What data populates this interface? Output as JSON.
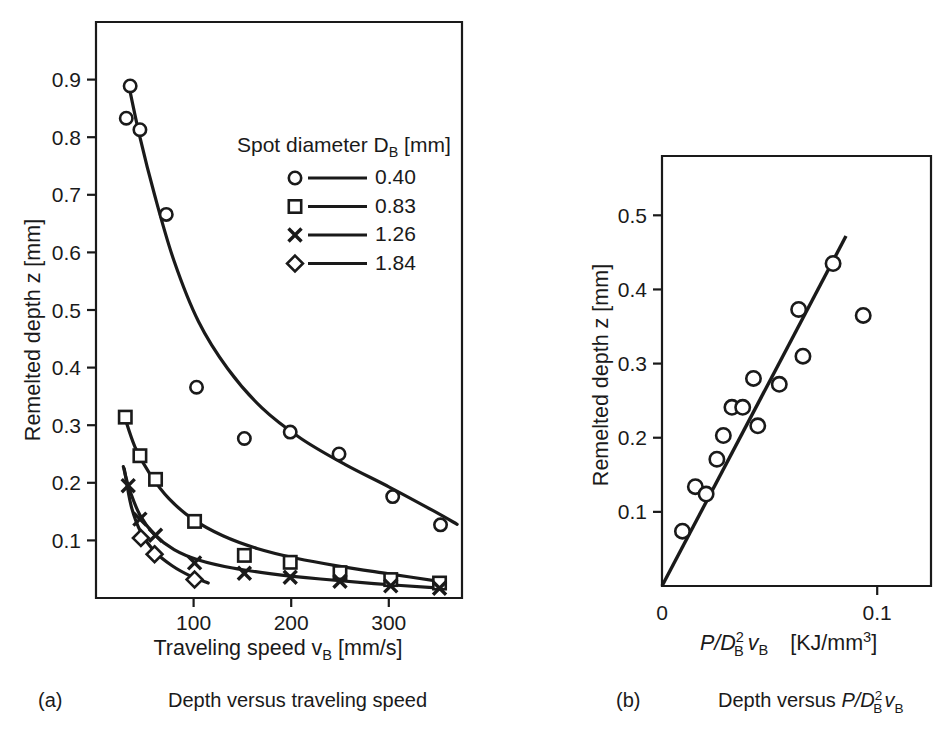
{
  "figure": {
    "background_color": "#ffffff",
    "ink_color": "#1a1a1a"
  },
  "panel_a": {
    "label": "(a)",
    "caption": "Depth versus traveling speed",
    "legend": {
      "title_main": "Spot diameter D",
      "title_sub": "B",
      "title_unit": " [mm]",
      "entries": [
        {
          "marker": "circle",
          "label": "0.40"
        },
        {
          "marker": "square",
          "label": "0.83"
        },
        {
          "marker": "cross",
          "label": "1.26"
        },
        {
          "marker": "diamond",
          "label": "1.84"
        }
      ]
    }
  },
  "panel_b": {
    "label": "(b)",
    "caption_prefix": "Depth versus ",
    "caption_expr_p": "P",
    "caption_expr_slash": "/",
    "caption_expr_d": "D",
    "caption_expr_d_sup": "2",
    "caption_expr_d_sub": "B",
    "caption_expr_v": "v",
    "caption_expr_v_sub": "B"
  },
  "chart_data": [
    {
      "type": "line",
      "panel": "a",
      "title": "Depth versus traveling speed",
      "xlabel_text": "Traveling speed v",
      "xlabel_sub": "B",
      "xlabel_unit": " [mm/s]",
      "ylabel_text": "Remelted depth z [mm]",
      "xlim": [
        0,
        375
      ],
      "ylim": [
        0,
        1.0
      ],
      "xticks": [
        100,
        200,
        300
      ],
      "xticklabels": [
        "100",
        "200",
        "300"
      ],
      "yticks": [
        0.1,
        0.2,
        0.3,
        0.4,
        0.5,
        0.6,
        0.7,
        0.8,
        0.9
      ],
      "yticklabels": [
        "0.1",
        "0.2",
        "0.3",
        "0.4",
        "0.5",
        "0.6",
        "0.7",
        "0.8",
        "0.9"
      ],
      "grid": false,
      "legend_position": "upper-center-right",
      "series": [
        {
          "name": "0.40",
          "marker": "circle",
          "points": [
            {
              "x": 35,
              "y": 0.889
            },
            {
              "x": 31,
              "y": 0.833
            },
            {
              "x": 45,
              "y": 0.813
            },
            {
              "x": 72,
              "y": 0.666
            },
            {
              "x": 103,
              "y": 0.366
            },
            {
              "x": 152,
              "y": 0.277
            },
            {
              "x": 199,
              "y": 0.288
            },
            {
              "x": 249,
              "y": 0.25
            },
            {
              "x": 304,
              "y": 0.176
            },
            {
              "x": 353,
              "y": 0.127
            }
          ],
          "fit_curve": [
            {
              "x": 33,
              "y": 0.895
            },
            {
              "x": 45,
              "y": 0.8
            },
            {
              "x": 60,
              "y": 0.7
            },
            {
              "x": 80,
              "y": 0.585
            },
            {
              "x": 105,
              "y": 0.48
            },
            {
              "x": 135,
              "y": 0.398
            },
            {
              "x": 170,
              "y": 0.33
            },
            {
              "x": 210,
              "y": 0.277
            },
            {
              "x": 255,
              "y": 0.232
            },
            {
              "x": 300,
              "y": 0.193
            },
            {
              "x": 345,
              "y": 0.152
            },
            {
              "x": 370,
              "y": 0.128
            }
          ]
        },
        {
          "name": "0.83",
          "marker": "square",
          "points": [
            {
              "x": 30,
              "y": 0.314
            },
            {
              "x": 45,
              "y": 0.247
            },
            {
              "x": 61,
              "y": 0.206
            },
            {
              "x": 101,
              "y": 0.133
            },
            {
              "x": 152,
              "y": 0.074
            },
            {
              "x": 199,
              "y": 0.062
            },
            {
              "x": 250,
              "y": 0.044
            },
            {
              "x": 302,
              "y": 0.032
            },
            {
              "x": 352,
              "y": 0.026
            }
          ],
          "fit_curve": [
            {
              "x": 29,
              "y": 0.316
            },
            {
              "x": 40,
              "y": 0.262
            },
            {
              "x": 55,
              "y": 0.216
            },
            {
              "x": 75,
              "y": 0.172
            },
            {
              "x": 100,
              "y": 0.136
            },
            {
              "x": 130,
              "y": 0.108
            },
            {
              "x": 165,
              "y": 0.086
            },
            {
              "x": 205,
              "y": 0.069
            },
            {
              "x": 250,
              "y": 0.055
            },
            {
              "x": 300,
              "y": 0.042
            },
            {
              "x": 355,
              "y": 0.028
            }
          ]
        },
        {
          "name": "1.26",
          "marker": "cross",
          "points": [
            {
              "x": 33,
              "y": 0.195
            },
            {
              "x": 45,
              "y": 0.137
            },
            {
              "x": 61,
              "y": 0.109
            },
            {
              "x": 101,
              "y": 0.061
            },
            {
              "x": 152,
              "y": 0.043
            },
            {
              "x": 199,
              "y": 0.036
            },
            {
              "x": 250,
              "y": 0.029
            },
            {
              "x": 302,
              "y": 0.021
            },
            {
              "x": 352,
              "y": 0.017
            }
          ],
          "fit_curve": [
            {
              "x": 28,
              "y": 0.228
            },
            {
              "x": 34,
              "y": 0.19
            },
            {
              "x": 45,
              "y": 0.144
            },
            {
              "x": 60,
              "y": 0.11
            },
            {
              "x": 80,
              "y": 0.084
            },
            {
              "x": 105,
              "y": 0.066
            },
            {
              "x": 140,
              "y": 0.052
            },
            {
              "x": 180,
              "y": 0.042
            },
            {
              "x": 230,
              "y": 0.033
            },
            {
              "x": 285,
              "y": 0.025
            },
            {
              "x": 345,
              "y": 0.018
            }
          ]
        },
        {
          "name": "1.84",
          "marker": "diamond",
          "points": [
            {
              "x": 46,
              "y": 0.104
            },
            {
              "x": 60,
              "y": 0.076
            },
            {
              "x": 101,
              "y": 0.032
            }
          ],
          "fit_curve": [
            {
              "x": 29,
              "y": 0.224
            },
            {
              "x": 36,
              "y": 0.16
            },
            {
              "x": 46,
              "y": 0.114
            },
            {
              "x": 60,
              "y": 0.081
            },
            {
              "x": 78,
              "y": 0.056
            },
            {
              "x": 97,
              "y": 0.038
            },
            {
              "x": 115,
              "y": 0.026
            }
          ]
        }
      ]
    },
    {
      "type": "scatter",
      "panel": "b",
      "title": "Depth versus P/D_B^2 v_B",
      "xlabel_p": "P",
      "xlabel_slash": "/",
      "xlabel_d": "D",
      "xlabel_d_sup": "2",
      "xlabel_d_sub": "B",
      "xlabel_v": "v",
      "xlabel_v_sub": "B",
      "xlabel_unit": "[KJ/mm",
      "xlabel_unit_sup": "3",
      "xlabel_unit_end": "]",
      "ylabel_text": "Remelted depth z [mm]",
      "xlim": [
        0,
        0.125
      ],
      "ylim": [
        0,
        0.58
      ],
      "xticks": [
        0,
        0.1
      ],
      "xticklabels": [
        "0",
        "0.1"
      ],
      "yticks": [
        0.1,
        0.2,
        0.3,
        0.4,
        0.5
      ],
      "yticklabels": [
        "0.1",
        "0.2",
        "0.3",
        "0.4",
        "0.5"
      ],
      "grid": false,
      "marker": "circle",
      "points": [
        {
          "x": 0.0095,
          "y": 0.074
        },
        {
          "x": 0.0155,
          "y": 0.134
        },
        {
          "x": 0.0205,
          "y": 0.124
        },
        {
          "x": 0.0255,
          "y": 0.171
        },
        {
          "x": 0.0285,
          "y": 0.203
        },
        {
          "x": 0.0325,
          "y": 0.241
        },
        {
          "x": 0.0375,
          "y": 0.241
        },
        {
          "x": 0.0425,
          "y": 0.28
        },
        {
          "x": 0.0445,
          "y": 0.216
        },
        {
          "x": 0.0545,
          "y": 0.272
        },
        {
          "x": 0.0635,
          "y": 0.373
        },
        {
          "x": 0.0655,
          "y": 0.31
        },
        {
          "x": 0.0795,
          "y": 0.435
        },
        {
          "x": 0.0935,
          "y": 0.365
        }
      ],
      "fit_line": {
        "x_start": 0.0,
        "y_start": 0.0,
        "x_end": 0.0855,
        "y_end": 0.472
      }
    }
  ]
}
